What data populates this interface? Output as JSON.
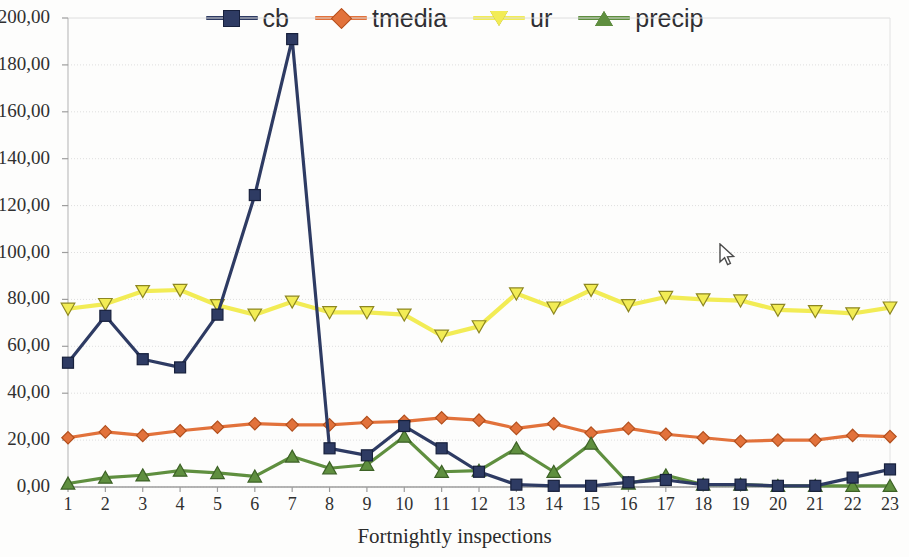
{
  "chart_data": {
    "type": "line",
    "title": "",
    "xlabel": "Fortnightly inspections",
    "ylabel": "",
    "x": [
      1,
      2,
      3,
      4,
      5,
      6,
      7,
      8,
      9,
      10,
      11,
      12,
      13,
      14,
      15,
      16,
      17,
      18,
      19,
      20,
      21,
      22,
      23
    ],
    "xtick_labels": [
      "1",
      "2",
      "3",
      "4",
      "5",
      "6",
      "7",
      "8",
      "9",
      "10",
      "11",
      "12",
      "13",
      "14",
      "15",
      "16",
      "17",
      "18",
      "19",
      "20",
      "21",
      "22",
      "23"
    ],
    "ytick_labels": [
      "0,00",
      "20,00",
      "40,00",
      "60,00",
      "80,00",
      "100,00",
      "120,00",
      "140,00",
      "160,00",
      "180,00",
      "200,00"
    ],
    "ytick_values": [
      0,
      20,
      40,
      60,
      80,
      100,
      120,
      140,
      160,
      180,
      200
    ],
    "ylim": [
      0,
      200
    ],
    "xlim": [
      1,
      23
    ],
    "grid": true,
    "legend_position": "top-center",
    "series": [
      {
        "name": "cb",
        "color": "#2e3b63",
        "marker": "square",
        "values": [
          53,
          73,
          54.5,
          51,
          73.5,
          124.5,
          191,
          16.5,
          13.5,
          26,
          16.5,
          6.5,
          1,
          0.5,
          0.5,
          2,
          3,
          1,
          1,
          0.5,
          0.5,
          4,
          7.5
        ]
      },
      {
        "name": "tmedia",
        "color": "#e2723b",
        "marker": "diamond",
        "values": [
          21,
          23.5,
          22,
          24,
          25.5,
          27,
          26.5,
          26.5,
          27.5,
          28,
          29.5,
          28.5,
          25,
          27,
          23,
          25,
          22.5,
          21,
          19.5,
          20,
          20,
          22,
          21.5
        ]
      },
      {
        "name": "ur",
        "color": "#f2ec55",
        "marker": "triangle-down",
        "values": [
          76,
          78,
          83.5,
          84,
          77.5,
          73.5,
          79,
          74.5,
          74.5,
          73.5,
          64.5,
          68.5,
          82.5,
          76.5,
          84,
          77.5,
          81,
          80,
          79.5,
          75.5,
          75,
          74,
          76.5
        ]
      },
      {
        "name": "precip",
        "color": "#5f8f3f",
        "marker": "triangle-up",
        "values": [
          1.5,
          4,
          5,
          7,
          6,
          4.5,
          13,
          8,
          9.5,
          21.5,
          6.5,
          7,
          16.5,
          6.5,
          18.5,
          1.5,
          5,
          1,
          1,
          0.5,
          0.5,
          0.5,
          0.5
        ]
      }
    ]
  },
  "legend": {
    "items": [
      {
        "label": "cb",
        "color": "#2e3b63",
        "marker": "square"
      },
      {
        "label": "tmedia",
        "color": "#e2723b",
        "marker": "diamond"
      },
      {
        "label": "ur",
        "color": "#f2ec55",
        "marker": "triangle-down"
      },
      {
        "label": "precip",
        "color": "#5f8f3f",
        "marker": "triangle-up"
      }
    ]
  },
  "axes": {
    "x_title": "Fortnightly inspections"
  },
  "cursor": {
    "x": 719,
    "y": 243,
    "icon": "mouse-pointer-icon"
  }
}
